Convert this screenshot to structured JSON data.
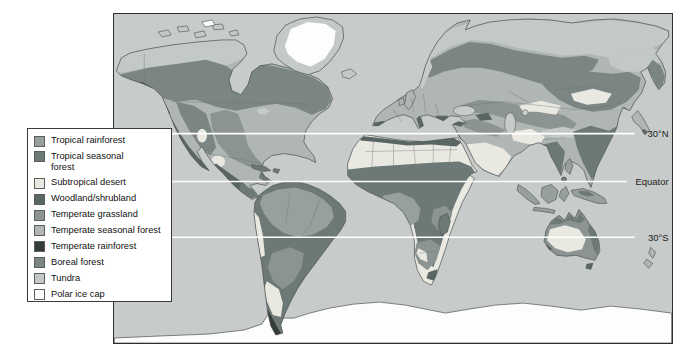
{
  "figure": {
    "type": "world-biome-map"
  },
  "colors": {
    "page_bg": "#ffffff",
    "ocean": "#c7cbca",
    "frame_border": "#2e2e2e",
    "coastline": "#4a4f4e",
    "country_border": "#6f7574",
    "latitude_line": "#ffffff",
    "label_text": "#1b1b1b",
    "legend_bg": "#ffffff",
    "legend_border": "#3a3a3a"
  },
  "legend": {
    "items": [
      {
        "label": "Tropical rainforest",
        "color": "#97a09e"
      },
      {
        "label": "Tropical seasonal forest",
        "color": "#6d7977"
      },
      {
        "label": "Subtropical desert",
        "color": "#e9e9e2"
      },
      {
        "label": "Woodland/shrubland",
        "color": "#5a6664"
      },
      {
        "label": "Temperate grassland",
        "color": "#8b9492"
      },
      {
        "label": "Temperate seasonal forest",
        "color": "#afb6b3"
      },
      {
        "label": "Temperate rainforest",
        "color": "#333c3b"
      },
      {
        "label": "Boreal forest",
        "color": "#7b8583"
      },
      {
        "label": "Tundra",
        "color": "#c2c9c6"
      },
      {
        "label": "Polar ice cap",
        "color": "#fdfdfb"
      }
    ]
  },
  "latitude_lines": [
    {
      "label": "30°N"
    },
    {
      "label": "Equator"
    },
    {
      "label": "30°S"
    }
  ]
}
